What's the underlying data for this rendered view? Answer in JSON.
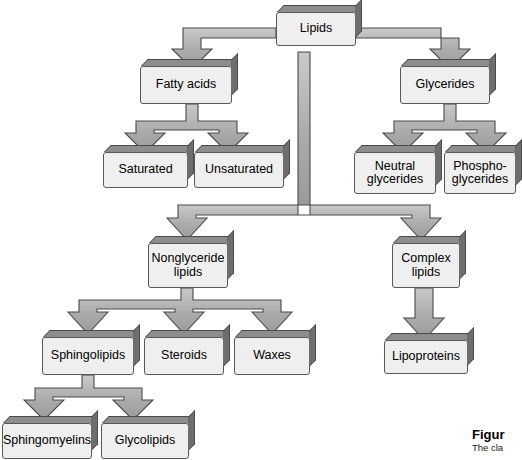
{
  "figure": {
    "root": "Lipids",
    "caption_title": "Figur",
    "caption_body": "The cla",
    "colors": {
      "box_fill": "#efefef",
      "box_outline": "#585858",
      "box_side_shadow": "#6e6e6e",
      "box_top_shadow": "#8d8d8d",
      "arrow_fill": "#a8a8a8",
      "arrow_outline": "#4a4a4a",
      "background": "#ffffff",
      "text": "#000000"
    }
  },
  "nodes": {
    "lipids": "Lipids",
    "fatty_acids": "Fatty acids",
    "glycerides": "Glycerides",
    "saturated": "Saturated",
    "unsaturated": "Unsaturated",
    "neutral_glycerides": "Neutral\nglycerides",
    "phospho_glycerides": "Phospho-\nglycerides",
    "nonglyceride_lipids": "Nonglyceride\nlipids",
    "complex_lipids": "Complex\nlipids",
    "sphingolipids": "Sphingolipids",
    "steroids": "Steroids",
    "waxes": "Waxes",
    "lipoproteins": "Lipoproteins",
    "sphingomyelins": "Sphingomyelins",
    "glycolipids": "Glycolipids"
  },
  "hierarchy": {
    "Lipids": [
      "Fatty acids",
      "Glycerides",
      "Nonglyceride lipids",
      "Complex lipids"
    ],
    "Fatty acids": [
      "Saturated",
      "Unsaturated"
    ],
    "Glycerides": [
      "Neutral glycerides",
      "Phospho-glycerides"
    ],
    "Nonglyceride lipids": [
      "Sphingolipids",
      "Steroids",
      "Waxes"
    ],
    "Complex lipids": [
      "Lipoproteins"
    ],
    "Sphingolipids": [
      "Sphingomyelins",
      "Glycolipids"
    ]
  }
}
